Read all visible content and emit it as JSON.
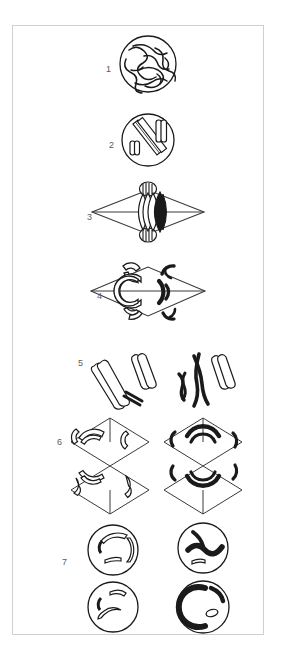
{
  "figure": {
    "background_color": "#ffffff",
    "frame_color": "#cfcfcf",
    "ink_color": "#1a1a1a",
    "label_color": "#5a5a5a",
    "width": 281,
    "height": 657
  },
  "stages": [
    {
      "number": "1",
      "name": "leptotene-nucleus",
      "description": "Nucleus with long tangled thin chromatin threads",
      "label_x": 105,
      "label_y": 64,
      "cell_cx": 147,
      "cell_cy": 63,
      "cell_r": 28
    },
    {
      "number": "2",
      "name": "condensed-chromosomes-nucleus",
      "description": "Nucleus with condensed outlined rod chromosomes",
      "label_x": 108,
      "label_y": 140,
      "cell_cx": 147,
      "cell_cy": 139,
      "cell_r": 26
    },
    {
      "number": "3",
      "name": "metaphase-i-spindle",
      "description": "Spindle diamond with chromosomes aligned at equator and centrioles at poles",
      "label_x": 86,
      "label_y": 212,
      "cell_cx": 147,
      "cell_cy": 211
    },
    {
      "number": "4",
      "name": "anaphase-i-spindle",
      "description": "Spindle with C-shaped chromosome arcs separating; outlined left half and filled right half",
      "label_x": 96,
      "label_y": 291,
      "cell_cx": 147,
      "cell_cy": 290
    },
    {
      "number": "5",
      "name": "separated-chromosome-pairs",
      "description": "X-shaped paired chromosomes, outlined group on left and filled group on right",
      "label_x": 77,
      "label_y": 358,
      "cell_cx": 147,
      "cell_cy": 360
    },
    {
      "number": "6",
      "name": "second-division-spindles",
      "description": "Two spindle diamonds of the second division with arcs moving to opposite poles",
      "label_x": 56,
      "label_y": 437,
      "cell_cx": 147,
      "cell_cy": 445
    },
    {
      "number": "7",
      "name": "four-daughter-cells",
      "description": "Four resulting daughter nuclei, two outlined and two filled",
      "label_x": 61,
      "label_y": 557,
      "cell_cx": 147,
      "cell_cy": 560
    }
  ]
}
